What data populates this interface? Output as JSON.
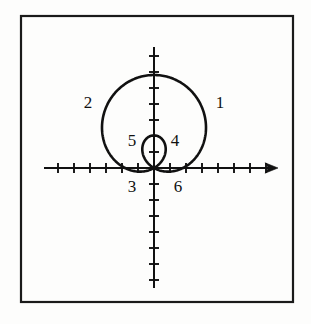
{
  "figure": {
    "background_color": "#fdfdfc",
    "ink_color": "#111111",
    "border": {
      "name": "figure-border",
      "x": 20,
      "y": 15,
      "width": 273,
      "height": 287,
      "stroke_width": 2.2,
      "color": "#1a1a1a"
    },
    "axes": {
      "origin_x": 154,
      "origin_y": 168,
      "stroke_width": 2.0,
      "color": "#111111",
      "tick_spacing": 16,
      "tick_half_length": 5,
      "x_axis": {
        "name": "x-axis",
        "x_start": 44,
        "x_end": 278,
        "arrow_end": "right",
        "ticks_left_of_origin": 7,
        "ticks_right_of_origin": 7
      },
      "y_axis": {
        "name": "y-axis",
        "y_top": 47,
        "y_bottom": 288,
        "arrow_end": "none",
        "ticks_above_origin": 7,
        "ticks_below_origin": 7
      }
    },
    "curve": {
      "name": "limacon-curve",
      "stroke_width": 2.6,
      "color": "#111111",
      "outer_loop": {
        "top_y": 75,
        "left_x": 96,
        "right_x": 200,
        "bottom_y": 168
      },
      "inner_loop": {
        "top_y": 130,
        "left_x": 141,
        "right_x": 167,
        "bottom_y": 168
      }
    },
    "labels": [
      {
        "id": "label-1",
        "text": "1",
        "x": 212,
        "y": 94
      },
      {
        "id": "label-2",
        "text": "2",
        "x": 80,
        "y": 94
      },
      {
        "id": "label-3",
        "text": "3",
        "x": 124,
        "y": 178
      },
      {
        "id": "label-4",
        "text": "4",
        "x": 167,
        "y": 132
      },
      {
        "id": "label-5",
        "text": "5",
        "x": 124,
        "y": 132
      },
      {
        "id": "label-6",
        "text": "6",
        "x": 170,
        "y": 178
      }
    ]
  },
  "chart_data": {
    "type": "line",
    "xlabel": "",
    "ylabel": "",
    "grid": false,
    "legend": null,
    "axis_style": "cartesian-cross-with-ticks",
    "xlim": [
      -7,
      7
    ],
    "ylim": [
      -7,
      7
    ],
    "tick_interval": 1,
    "curve_description": "Polar limacon r = a + b*sin(theta) with b > a, producing a large upper loop and a small inner loop, both passing through the origin",
    "annotations": [
      {
        "label": "1",
        "meaning": "outer loop, upper-right arc"
      },
      {
        "label": "2",
        "meaning": "outer loop, upper-left arc"
      },
      {
        "label": "3",
        "meaning": "outer loop, lower-left near origin"
      },
      {
        "label": "4",
        "meaning": "inner loop, right side"
      },
      {
        "label": "5",
        "meaning": "inner loop, left side"
      },
      {
        "label": "6",
        "meaning": "outer loop, lower-right near origin"
      }
    ],
    "series": [
      {
        "name": "outer loop",
        "points_xy": [
          [
            0,
            0
          ],
          [
            -1.4,
            1.0
          ],
          [
            -2.6,
            2.2
          ],
          [
            -3.4,
            3.6
          ],
          [
            -3.6,
            5.0
          ],
          [
            -3.0,
            5.6
          ],
          [
            -1.6,
            5.8
          ],
          [
            0,
            5.85
          ],
          [
            1.6,
            5.8
          ],
          [
            3.0,
            5.6
          ],
          [
            3.6,
            5.0
          ],
          [
            3.4,
            3.6
          ],
          [
            2.6,
            2.2
          ],
          [
            1.4,
            1.0
          ],
          [
            0,
            0
          ]
        ]
      },
      {
        "name": "inner loop",
        "points_xy": [
          [
            0,
            0
          ],
          [
            -0.5,
            0.6
          ],
          [
            -0.82,
            1.4
          ],
          [
            -0.7,
            2.1
          ],
          [
            0,
            2.4
          ],
          [
            0.7,
            2.1
          ],
          [
            0.82,
            1.4
          ],
          [
            0.5,
            0.6
          ],
          [
            0,
            0
          ]
        ]
      }
    ]
  }
}
